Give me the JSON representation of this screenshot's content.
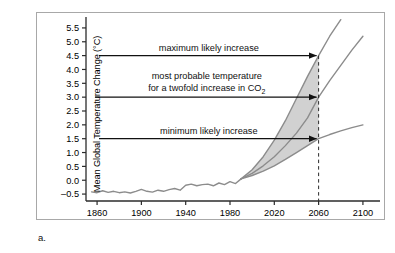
{
  "figure": {
    "panel_label": "a.",
    "frame_color": "#a8a8a8",
    "background": "#ffffff"
  },
  "chart_data": {
    "type": "line",
    "title": "",
    "xlabel": "Year",
    "ylabel": "Mean Global Temperature Change (°C)",
    "xlim": [
      1850,
      2110
    ],
    "ylim": [
      -0.75,
      5.75
    ],
    "grid": false,
    "legend_position": "none",
    "xticks": [
      1860,
      1900,
      1940,
      1980,
      2020,
      2060,
      2100
    ],
    "xtick_labels": [
      "1860",
      "1900",
      "1940",
      "1980",
      "2020",
      "2060",
      "2100"
    ],
    "yticks": [
      -0.5,
      0.0,
      0.5,
      1.0,
      1.5,
      2.0,
      2.5,
      3.0,
      3.5,
      4.0,
      4.5,
      5.0,
      5.5
    ],
    "ytick_labels": [
      "–0.5",
      "0.0",
      "0.5",
      "1.0",
      "1.5",
      "2.0",
      "2.5",
      "3.0",
      "3.5",
      "4.0",
      "4.5",
      "5.0",
      "5.5"
    ],
    "series": [
      {
        "name": "observed-record",
        "style": "solid",
        "color": "#8c8c8c",
        "x": [
          1855,
          1860,
          1865,
          1870,
          1875,
          1880,
          1885,
          1890,
          1895,
          1900,
          1905,
          1910,
          1915,
          1920,
          1925,
          1930,
          1935,
          1940,
          1945,
          1950,
          1955,
          1960,
          1965,
          1970,
          1975,
          1980,
          1985,
          1990
        ],
        "values": [
          -0.42,
          -0.45,
          -0.38,
          -0.44,
          -0.4,
          -0.45,
          -0.42,
          -0.46,
          -0.4,
          -0.33,
          -0.4,
          -0.43,
          -0.36,
          -0.4,
          -0.34,
          -0.3,
          -0.36,
          -0.18,
          -0.14,
          -0.2,
          -0.16,
          -0.14,
          -0.2,
          -0.1,
          -0.16,
          -0.05,
          -0.12,
          0.05
        ]
      },
      {
        "name": "maximum-likely-increase",
        "style": "solid",
        "color": "#8c8c8c",
        "x": [
          1990,
          2000,
          2010,
          2020,
          2030,
          2040,
          2050,
          2060,
          2070,
          2080
        ],
        "values": [
          0.05,
          0.38,
          0.85,
          1.45,
          2.15,
          2.95,
          3.75,
          4.5,
          5.2,
          5.8
        ]
      },
      {
        "name": "most-probable-increase",
        "style": "solid",
        "color": "#8c8c8c",
        "x": [
          1990,
          2000,
          2010,
          2020,
          2030,
          2040,
          2050,
          2060,
          2070,
          2080,
          2090,
          2100
        ],
        "values": [
          0.05,
          0.25,
          0.52,
          0.85,
          1.25,
          1.7,
          2.25,
          3.0,
          3.6,
          4.15,
          4.7,
          5.2
        ]
      },
      {
        "name": "minimum-likely-increase",
        "style": "solid",
        "color": "#8c8c8c",
        "x": [
          1990,
          2000,
          2010,
          2020,
          2030,
          2040,
          2050,
          2060,
          2070,
          2080,
          2090,
          2100
        ],
        "values": [
          0.05,
          0.17,
          0.33,
          0.52,
          0.75,
          1.0,
          1.25,
          1.5,
          1.65,
          1.78,
          1.9,
          2.0
        ]
      }
    ],
    "shaded_band": {
      "name": "likely-range-envelope",
      "fill": "#c9c9c9",
      "opacity": 0.85,
      "upper_series": "maximum-likely-increase",
      "lower_series": "minimum-likely-increase",
      "x_start": 1990,
      "x_end": 2060
    },
    "annotations": [
      {
        "id": "max",
        "text": "maximum likely increase",
        "lines": [
          "maximum likely increase"
        ],
        "value": 4.5,
        "arrow_to_year": 2060,
        "arrow_to_value": 4.5
      },
      {
        "id": "probable",
        "text": "most probable temperature for a twofold increase in CO2",
        "lines": [
          "most probable temperature",
          "for a twofold increase in CO"
        ],
        "subscript": "2",
        "value": 3.0,
        "arrow_to_year": 2060,
        "arrow_to_value": 3.0
      },
      {
        "id": "min",
        "text": "minimum likely increase",
        "lines": [
          "minimum likely increase"
        ],
        "value": 1.5,
        "arrow_to_year": 2060,
        "arrow_to_value": 1.5
      }
    ],
    "reference_line": {
      "name": "year-2060-marker",
      "orientation": "vertical",
      "year": 2060,
      "style": "dashed",
      "from_value": -0.75,
      "to_value": 4.5
    }
  }
}
